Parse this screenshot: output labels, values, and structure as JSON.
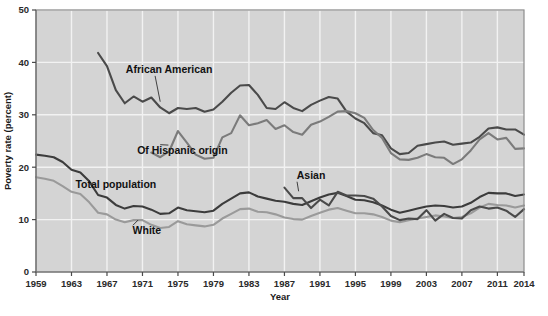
{
  "chart_data": {
    "type": "line",
    "title": "",
    "xlabel": "Year",
    "ylabel": "Poverty rate (percent)",
    "xlim": [
      1959,
      2014
    ],
    "ylim": [
      0,
      50
    ],
    "ytick_values": [
      0,
      10,
      20,
      30,
      40,
      50
    ],
    "ytick_labels": [
      "0",
      "10",
      "20",
      "30",
      "40",
      "50"
    ],
    "xtick_values": [
      1959,
      1963,
      1967,
      1971,
      1975,
      1979,
      1983,
      1987,
      1991,
      1995,
      1999,
      2003,
      2007,
      2011,
      2014
    ],
    "xtick_labels": [
      "1959",
      "1963",
      "1967",
      "1971",
      "1975",
      "1979",
      "1983",
      "1987",
      "1991",
      "1995",
      "1999",
      "2003",
      "2007",
      "2011",
      "2014"
    ],
    "grid": "white gridlines on gray panel, both axes at tick values",
    "legend": "inline labels with leader lines, no legend box",
    "plot_background": "#d4d4d4",
    "gridline_color": "#f2f2f2",
    "series": [
      {
        "name": "African American",
        "color": "#4a4a4a",
        "label_x": 1974.0,
        "label_y": 38.0,
        "leader_to_x": 1973.0,
        "leader_to_y": 32.5,
        "x": [
          1966,
          1967,
          1968,
          1969,
          1970,
          1971,
          1972,
          1973,
          1974,
          1975,
          1976,
          1977,
          1978,
          1979,
          1980,
          1981,
          1982,
          1983,
          1984,
          1985,
          1986,
          1987,
          1988,
          1989,
          1990,
          1991,
          1992,
          1993,
          1994,
          1995,
          1996,
          1997,
          1998,
          1999,
          2000,
          2001,
          2002,
          2003,
          2004,
          2005,
          2006,
          2007,
          2008,
          2009,
          2010,
          2011,
          2012,
          2013,
          2014
        ],
        "y": [
          41.8,
          39.3,
          34.7,
          32.2,
          33.5,
          32.5,
          33.3,
          31.4,
          30.3,
          31.3,
          31.1,
          31.3,
          30.6,
          31.0,
          32.5,
          34.2,
          35.6,
          35.7,
          33.8,
          31.3,
          31.1,
          32.4,
          31.3,
          30.7,
          31.9,
          32.7,
          33.4,
          33.1,
          30.6,
          29.3,
          28.4,
          26.5,
          26.1,
          23.6,
          22.5,
          22.7,
          24.1,
          24.4,
          24.7,
          24.9,
          24.3,
          24.5,
          24.7,
          25.8,
          27.4,
          27.6,
          27.2,
          27.2,
          26.2
        ]
      },
      {
        "name": "Of Hispanic origin",
        "color": "#7b7b7b",
        "label_x": 1975.5,
        "label_y": 22.5,
        "leader_to_x": 1973.0,
        "leader_to_y": 24.3,
        "x": [
          1972,
          1973,
          1974,
          1975,
          1976,
          1977,
          1978,
          1979,
          1980,
          1981,
          1982,
          1983,
          1984,
          1985,
          1986,
          1987,
          1988,
          1989,
          1990,
          1991,
          1992,
          1993,
          1994,
          1995,
          1996,
          1997,
          1998,
          1999,
          2000,
          2001,
          2002,
          2003,
          2004,
          2005,
          2006,
          2007,
          2008,
          2009,
          2010,
          2011,
          2012,
          2013,
          2014
        ],
        "y": [
          22.8,
          21.9,
          23.0,
          26.9,
          24.7,
          22.4,
          21.6,
          21.8,
          25.7,
          26.5,
          29.9,
          28.0,
          28.4,
          29.0,
          27.3,
          28.0,
          26.7,
          26.2,
          28.1,
          28.7,
          29.6,
          30.6,
          30.7,
          30.3,
          29.4,
          27.1,
          25.6,
          22.7,
          21.5,
          21.4,
          21.8,
          22.5,
          21.9,
          21.8,
          20.6,
          21.5,
          23.2,
          25.3,
          26.5,
          25.3,
          25.6,
          23.5,
          23.6
        ]
      },
      {
        "name": "Total population",
        "color": "#3c3c3c",
        "label_x": 1968.0,
        "label_y": 16.0,
        "leader_to_x": null,
        "leader_to_y": null,
        "x": [
          1959,
          1960,
          1961,
          1962,
          1963,
          1964,
          1965,
          1966,
          1967,
          1968,
          1969,
          1970,
          1971,
          1972,
          1973,
          1974,
          1975,
          1976,
          1977,
          1978,
          1979,
          1980,
          1981,
          1982,
          1983,
          1984,
          1985,
          1986,
          1987,
          1988,
          1989,
          1990,
          1991,
          1992,
          1993,
          1994,
          1995,
          1996,
          1997,
          1998,
          1999,
          2000,
          2001,
          2002,
          2003,
          2004,
          2005,
          2006,
          2007,
          2008,
          2009,
          2010,
          2011,
          2012,
          2013,
          2014
        ],
        "y": [
          22.4,
          22.2,
          21.9,
          21.0,
          19.5,
          19.0,
          17.3,
          14.7,
          14.2,
          12.8,
          12.1,
          12.6,
          12.5,
          11.9,
          11.1,
          11.2,
          12.3,
          11.8,
          11.6,
          11.4,
          11.7,
          13.0,
          14.0,
          15.0,
          15.2,
          14.4,
          14.0,
          13.6,
          13.4,
          13.0,
          12.8,
          13.5,
          14.2,
          14.8,
          15.1,
          14.5,
          13.8,
          13.7,
          13.3,
          12.7,
          11.9,
          11.3,
          11.7,
          12.1,
          12.5,
          12.7,
          12.6,
          12.3,
          12.5,
          13.2,
          14.3,
          15.1,
          15.0,
          15.0,
          14.5,
          14.8
        ]
      },
      {
        "name": "White",
        "color": "#9a9a9a",
        "label_x": 1971.5,
        "label_y": 7.2,
        "leader_to_x": 1970.5,
        "leader_to_y": 9.9,
        "x": [
          1959,
          1960,
          1961,
          1962,
          1963,
          1964,
          1965,
          1966,
          1967,
          1968,
          1969,
          1970,
          1971,
          1972,
          1973,
          1974,
          1975,
          1976,
          1977,
          1978,
          1979,
          1980,
          1981,
          1982,
          1983,
          1984,
          1985,
          1986,
          1987,
          1988,
          1989,
          1990,
          1991,
          1992,
          1993,
          1994,
          1995,
          1996,
          1997,
          1998,
          1999,
          2000,
          2001,
          2002,
          2003,
          2004,
          2005,
          2006,
          2007,
          2008,
          2009,
          2010,
          2011,
          2012,
          2013,
          2014
        ],
        "y": [
          18.1,
          17.8,
          17.4,
          16.4,
          15.3,
          14.9,
          13.3,
          11.3,
          11.0,
          10.0,
          9.5,
          9.9,
          9.9,
          9.0,
          8.4,
          8.6,
          9.7,
          9.1,
          8.9,
          8.7,
          9.0,
          10.2,
          11.1,
          12.0,
          12.1,
          11.5,
          11.4,
          11.0,
          10.4,
          10.1,
          10.0,
          10.7,
          11.3,
          11.9,
          12.2,
          11.7,
          11.2,
          11.2,
          11.0,
          10.5,
          9.8,
          9.5,
          9.9,
          10.2,
          10.5,
          10.8,
          10.6,
          10.3,
          10.5,
          11.2,
          12.3,
          13.0,
          12.8,
          12.7,
          12.3,
          12.7
        ]
      },
      {
        "name": "Asian",
        "color": "#4a4a4a",
        "label_x": 1990.0,
        "label_y": 17.8,
        "leader_to_x": 1988.6,
        "leader_to_y": 15.4,
        "x": [
          1987,
          1988,
          1989,
          1990,
          1991,
          1992,
          1993,
          1994,
          1995,
          1996,
          1997,
          1998,
          1999,
          2000,
          2001,
          2002,
          2003,
          2004,
          2005,
          2006,
          2007,
          2008,
          2009,
          2010,
          2011,
          2012,
          2013,
          2014
        ],
        "y": [
          16.1,
          14.1,
          14.1,
          12.2,
          13.8,
          12.7,
          15.3,
          14.6,
          14.6,
          14.5,
          14.0,
          12.5,
          10.7,
          9.9,
          10.2,
          10.1,
          11.8,
          9.8,
          11.1,
          10.3,
          10.2,
          11.8,
          12.5,
          12.1,
          12.3,
          11.7,
          10.5,
          12.0
        ]
      }
    ]
  }
}
